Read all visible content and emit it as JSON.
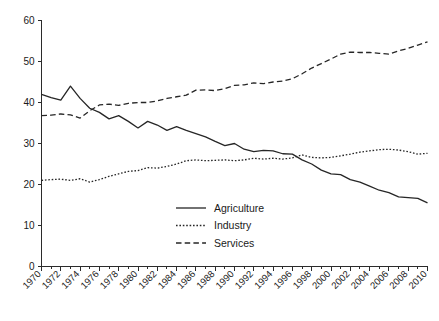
{
  "chart_data": {
    "type": "line",
    "title": "",
    "subtitle": "",
    "xlabel": "",
    "ylabel": "",
    "xlim": [
      1970,
      2010
    ],
    "ylim": [
      0,
      60
    ],
    "yticks": [
      0,
      10,
      20,
      30,
      40,
      50,
      60
    ],
    "ytick_labels": [
      "0",
      "10",
      "20",
      "30",
      "40",
      "50",
      "60"
    ],
    "xticks": [
      1970,
      1972,
      1974,
      1976,
      1978,
      1980,
      1982,
      1984,
      1986,
      1988,
      1990,
      1992,
      1994,
      1996,
      1998,
      2000,
      2002,
      2004,
      2006,
      2008,
      2010
    ],
    "xtick_labels": [
      "1970",
      "1972",
      "1974",
      "1976",
      "1978",
      "1980",
      "1982",
      "1984",
      "1986",
      "1988",
      "1990",
      "1992",
      "1994",
      "1996",
      "1998",
      "2000",
      "2002",
      "2004",
      "2006",
      "2008",
      "2010"
    ],
    "x": [
      1970,
      1971,
      1972,
      1973,
      1974,
      1975,
      1976,
      1977,
      1978,
      1979,
      1980,
      1981,
      1982,
      1983,
      1984,
      1985,
      1986,
      1987,
      1988,
      1989,
      1990,
      1991,
      1992,
      1993,
      1994,
      1995,
      1996,
      1997,
      1998,
      1999,
      2000,
      2001,
      2002,
      2003,
      2004,
      2005,
      2006,
      2007,
      2008,
      2009,
      2010
    ],
    "grid": false,
    "legend_position": "lower-center",
    "series": [
      {
        "name": "Agriculture",
        "style": "solid",
        "values": [
          42.0,
          41.2,
          40.6,
          44.0,
          41.0,
          38.6,
          37.6,
          36.0,
          36.8,
          35.4,
          33.8,
          35.4,
          34.5,
          33.2,
          34.1,
          33.2,
          32.4,
          31.6,
          30.5,
          29.5,
          30.0,
          28.6,
          28.0,
          28.3,
          28.2,
          27.5,
          27.4,
          26.0,
          25.0,
          23.5,
          22.6,
          22.4,
          21.2,
          20.6,
          19.6,
          18.6,
          18.0,
          17.0,
          16.8,
          16.6,
          15.5
        ]
      },
      {
        "name": "Industry",
        "style": "dotted",
        "values": [
          21.0,
          21.2,
          21.3,
          21.0,
          21.4,
          20.6,
          21.2,
          22.0,
          22.6,
          23.2,
          23.4,
          24.1,
          24.0,
          24.4,
          25.0,
          25.8,
          26.0,
          25.8,
          25.9,
          26.0,
          25.8,
          26.0,
          26.4,
          26.2,
          26.4,
          26.2,
          26.5,
          27.2,
          26.6,
          26.5,
          26.6,
          27.0,
          27.4,
          27.9,
          28.2,
          28.5,
          28.6,
          28.4,
          28.0,
          27.4,
          27.6
        ]
      },
      {
        "name": "Services",
        "style": "dashed",
        "values": [
          36.8,
          36.9,
          37.2,
          37.0,
          36.2,
          38.0,
          39.4,
          39.6,
          39.3,
          39.8,
          40.0,
          40.0,
          40.4,
          41.0,
          41.4,
          41.8,
          43.0,
          43.1,
          42.9,
          43.4,
          44.2,
          44.3,
          44.8,
          44.6,
          45.0,
          45.2,
          45.8,
          47.0,
          48.4,
          49.5,
          50.6,
          51.8,
          52.3,
          52.2,
          52.2,
          52.0,
          51.8,
          52.6,
          53.2,
          54.0,
          54.8
        ]
      }
    ],
    "legend": [
      {
        "label": "Agriculture",
        "style": "solid"
      },
      {
        "label": "Industry",
        "style": "dotted"
      },
      {
        "label": "Services",
        "style": "dashed"
      }
    ],
    "colors": {
      "line": "#262626",
      "axis": "#2b2b2b",
      "text": "#1a1a1a",
      "background": "#ffffff"
    }
  }
}
